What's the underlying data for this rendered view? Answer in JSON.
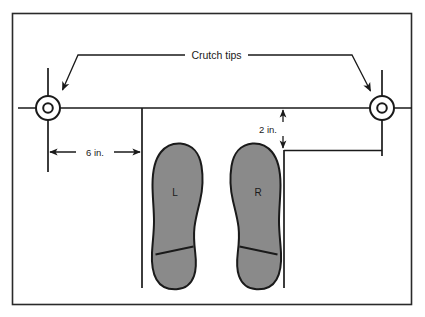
{
  "figure": {
    "border_color": "#1a1a1a",
    "background_color": "#ffffff",
    "line_color": "#1a1a1a",
    "foot_fill_color": "#8a8a8a",
    "foot_outline_color": "#1a1a1a"
  },
  "labels": {
    "crutch_tips": "Crutch tips",
    "horizontal_dimension": "6 in.",
    "vertical_dimension": "2 in.",
    "left_foot": "L",
    "right_foot": "R"
  },
  "annotations": {
    "crutch_tip_left_name": "left crutch tip",
    "crutch_tip_right_name": "right crutch tip",
    "leader_arrow_count": 2
  },
  "measurements": {
    "lateral_offset_value": 6,
    "lateral_offset_unit": "in.",
    "anterior_offset_value": 2,
    "anterior_offset_unit": "in."
  }
}
